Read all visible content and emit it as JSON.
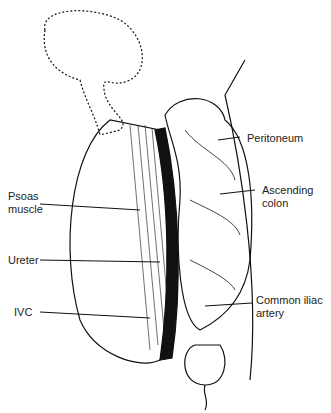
{
  "diagram": {
    "type": "anatomical illustration",
    "labels": {
      "peritoneum": "Peritoneum",
      "ascending_colon": "Ascending\ncolon",
      "psoas_muscle": "Psoas\nmuscle",
      "ureter": "Ureter",
      "ivc": "IVC",
      "common_iliac_artery": "Common iliac\nartery"
    },
    "colors": {
      "ink": "#111111",
      "background": "#ffffff"
    }
  }
}
